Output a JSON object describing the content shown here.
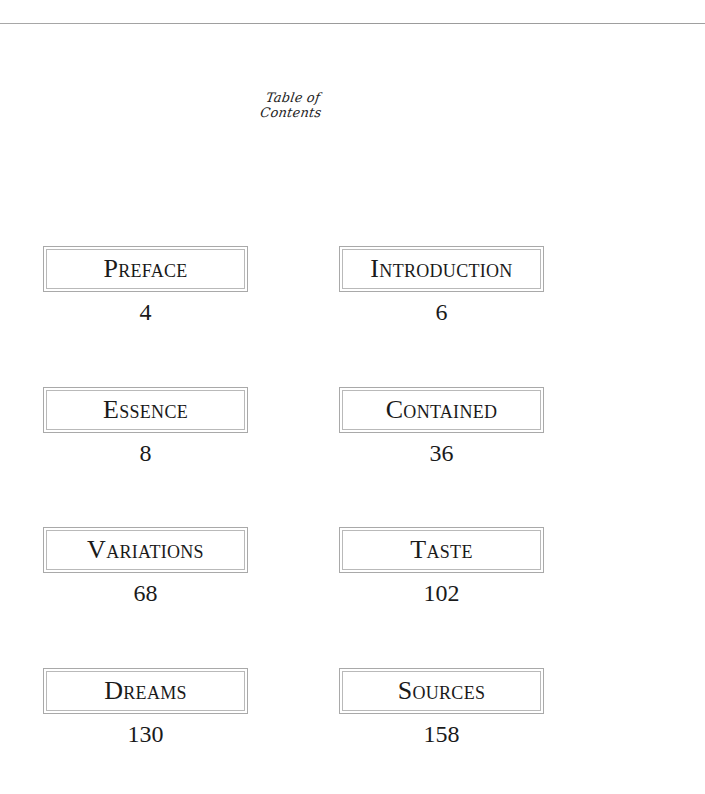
{
  "document": {
    "title": "Table of Contents",
    "entries": [
      {
        "label": "Preface",
        "page": "4"
      },
      {
        "label": "Introduction",
        "page": "6"
      },
      {
        "label": "Essence",
        "page": "8"
      },
      {
        "label": "Contained",
        "page": "36"
      },
      {
        "label": "Variations",
        "page": "68"
      },
      {
        "label": "Taste",
        "page": "102"
      },
      {
        "label": "Dreams",
        "page": "130"
      },
      {
        "label": "Sources",
        "page": "158"
      }
    ]
  },
  "colors": {
    "background": "#ffffff",
    "text": "#1a1a1a",
    "border": "#a9a9a9",
    "rule": "#9a9a9a"
  }
}
